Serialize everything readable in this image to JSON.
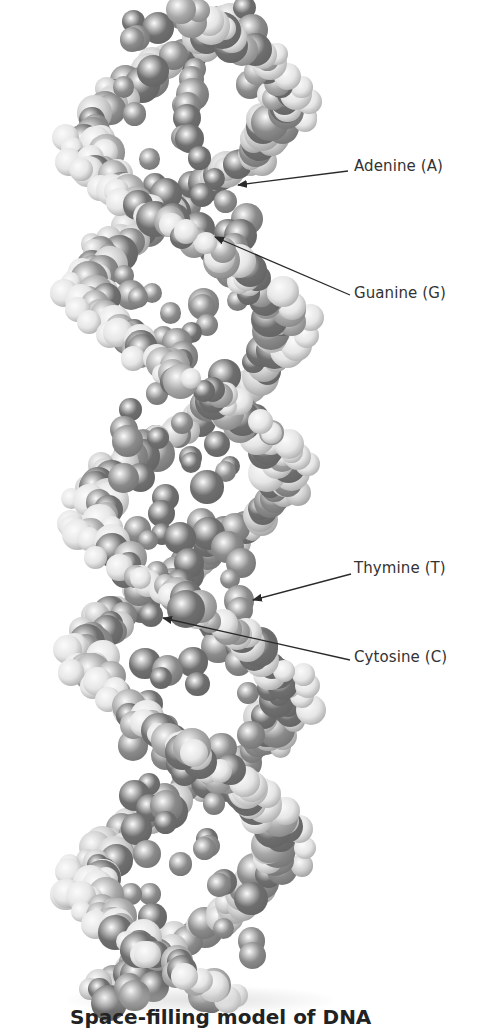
{
  "figure": {
    "title": "Space-filling model of DNA",
    "style": "grayscale space-filling molecular model",
    "colors": {
      "background": "#ffffff",
      "light_atom": "#e6e6e6",
      "mid_atom": "#a8a8a8",
      "dark_atom": "#6e6e6e",
      "label_text": "#333333",
      "arrow": "#2a2a2a"
    },
    "helix": {
      "center_x": 188,
      "top_y": 10,
      "bottom_y": 1000,
      "half_width": 118,
      "turn_period_px": 370
    },
    "labels": [
      {
        "name": "adenine",
        "text": "Adenine (A)",
        "x": 354,
        "y": 157,
        "arrow": {
          "from": [
            348,
            171
          ],
          "to": [
            238,
            185
          ]
        }
      },
      {
        "name": "guanine",
        "text": "Guanine (G)",
        "x": 354,
        "y": 284,
        "arrow": {
          "from": [
            350,
            295
          ],
          "to": [
            215,
            237
          ]
        }
      },
      {
        "name": "thymine",
        "text": "Thymine (T)",
        "x": 354,
        "y": 559,
        "arrow": {
          "from": [
            351,
            574
          ],
          "to": [
            253,
            600
          ]
        }
      },
      {
        "name": "cytosine",
        "text": "Cytosine (C)",
        "x": 354,
        "y": 648,
        "arrow": {
          "from": [
            350,
            660
          ],
          "to": [
            163,
            618
          ]
        }
      }
    ]
  }
}
